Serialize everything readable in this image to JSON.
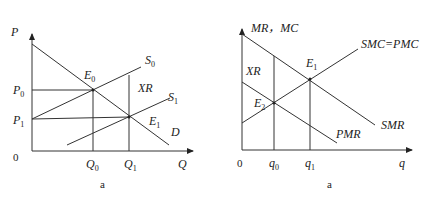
{
  "figures": [
    {
      "id": "left",
      "caption": "a",
      "y_axis_label": "P",
      "x_axis_label": "Q",
      "origin_label": "0",
      "price_labels": [
        {
          "text": "P",
          "sub": "0"
        },
        {
          "text": "P",
          "sub": "1"
        }
      ],
      "quantity_labels": [
        {
          "text": "Q",
          "sub": "0"
        },
        {
          "text": "Q",
          "sub": "1"
        }
      ],
      "curves": [
        {
          "name": "S",
          "sub": "0"
        },
        {
          "name": "S",
          "sub": "1"
        },
        {
          "name": "D",
          "sub": ""
        }
      ],
      "points": [
        {
          "text": "E",
          "sub": "0"
        },
        {
          "text": "E",
          "sub": "1"
        }
      ],
      "area_label": "XR"
    },
    {
      "id": "right",
      "caption": "a",
      "y_axis_label": "MR，MC",
      "x_axis_label": "q",
      "origin_label": "0",
      "quantity_labels": [
        {
          "text": "q",
          "sub": "0"
        },
        {
          "text": "q",
          "sub": "1"
        }
      ],
      "curves": [
        {
          "name": "SMC=PMC"
        },
        {
          "name": "SMR"
        },
        {
          "name": "PMR"
        }
      ],
      "points": [
        {
          "text": "E",
          "sub": "1"
        },
        {
          "text": "E",
          "sub": "2"
        }
      ],
      "area_label": "XR"
    }
  ]
}
